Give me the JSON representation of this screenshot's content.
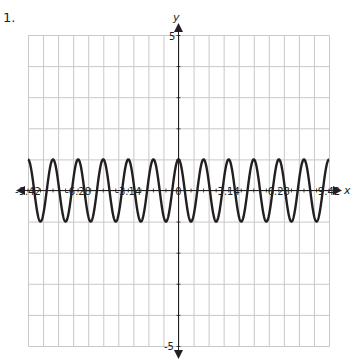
{
  "problem": {
    "number_label": "1."
  },
  "chart_data": {
    "type": "line",
    "title": "",
    "xlabel": "x",
    "ylabel": "y",
    "function": "y = cos(4x)",
    "xlim": [
      -9.42,
      9.42
    ],
    "ylim": [
      -5,
      5
    ],
    "x_tick_labels": [
      "-9.42",
      "-6.28",
      "-3.14",
      "0",
      "3.14",
      "6.28",
      "9.42"
    ],
    "x_tick_values": [
      -9.42,
      -6.28,
      -3.14,
      0,
      3.14,
      6.28,
      9.42
    ],
    "y_tick_labels": [
      "5",
      "-5"
    ],
    "y_tick_values": [
      5,
      -5
    ],
    "grid": true,
    "grid_columns": 20,
    "grid_rows": 10,
    "amplitude": 1,
    "period": 1.57,
    "series": [
      {
        "name": "cos(4x)",
        "x": [
          -9.42,
          -7.85,
          -6.28,
          -4.71,
          -3.14,
          -1.57,
          0,
          1.57,
          3.14,
          4.71,
          6.28,
          7.85,
          9.42
        ],
        "values": [
          1,
          1,
          1,
          1,
          1,
          1,
          1,
          1,
          1,
          1,
          1,
          1,
          1
        ]
      }
    ],
    "colors": {
      "curve": "#231f20",
      "grid": "#c8c8c8",
      "axis": "#231f20"
    }
  }
}
